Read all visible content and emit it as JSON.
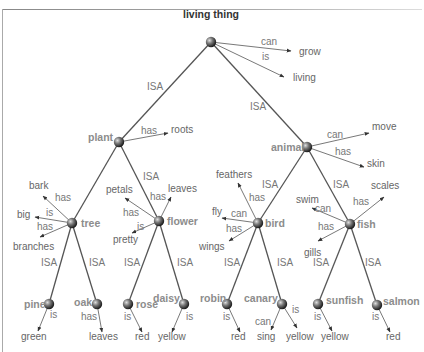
{
  "diagram": {
    "type": "semantic-network",
    "root": {
      "id": "living_thing",
      "label": "living thing"
    },
    "nodes": [
      {
        "id": "living_thing",
        "label": "living thing",
        "x": 211,
        "y": 42,
        "lx": 183,
        "ly": 18,
        "anchor": "start",
        "root": true
      },
      {
        "id": "plant",
        "label": "plant",
        "x": 119,
        "y": 142,
        "lx": 88,
        "ly": 141,
        "anchor": "start"
      },
      {
        "id": "animal",
        "label": "animal",
        "x": 307,
        "y": 147,
        "lx": 271,
        "ly": 151,
        "anchor": "start"
      },
      {
        "id": "tree",
        "label": "tree",
        "x": 72,
        "y": 223,
        "lx": 81,
        "ly": 227,
        "anchor": "start"
      },
      {
        "id": "flower",
        "label": "flower",
        "x": 159,
        "y": 221,
        "lx": 167,
        "ly": 225,
        "anchor": "start"
      },
      {
        "id": "bird",
        "label": "bird",
        "x": 258,
        "y": 223,
        "lx": 265,
        "ly": 227,
        "anchor": "start"
      },
      {
        "id": "fish",
        "label": "fish",
        "x": 350,
        "y": 224,
        "lx": 357,
        "ly": 228,
        "anchor": "start"
      },
      {
        "id": "pine",
        "label": "pine",
        "x": 49,
        "y": 304,
        "lx": 24,
        "ly": 308,
        "anchor": "start"
      },
      {
        "id": "oak",
        "label": "oak",
        "x": 97,
        "y": 304,
        "lx": 74,
        "ly": 306,
        "anchor": "start"
      },
      {
        "id": "rose",
        "label": "rose",
        "x": 128,
        "y": 304,
        "lx": 136,
        "ly": 308,
        "anchor": "start"
      },
      {
        "id": "daisy",
        "label": "daisy",
        "x": 184,
        "y": 304,
        "lx": 153,
        "ly": 302,
        "anchor": "start"
      },
      {
        "id": "robin",
        "label": "robin",
        "x": 227,
        "y": 304,
        "lx": 200,
        "ly": 302,
        "anchor": "start"
      },
      {
        "id": "canary",
        "label": "canary",
        "x": 282,
        "y": 304,
        "lx": 244,
        "ly": 302,
        "anchor": "start"
      },
      {
        "id": "sunfish",
        "label": "sunfish",
        "x": 318,
        "y": 304,
        "lx": 326,
        "ly": 304,
        "anchor": "start"
      },
      {
        "id": "salmon",
        "label": "salmon",
        "x": 377,
        "y": 305,
        "lx": 383,
        "ly": 305,
        "anchor": "start"
      }
    ],
    "isa_edges": [
      {
        "from": "living_thing",
        "to": "plant",
        "label": "ISA",
        "lx": 147,
        "ly": 90
      },
      {
        "from": "living_thing",
        "to": "animal",
        "label": "ISA",
        "lx": 250,
        "ly": 110
      },
      {
        "from": "plant",
        "to": "tree",
        "label": "ISA",
        "lx": 0,
        "ly": 0,
        "hidden_label": true
      },
      {
        "from": "plant",
        "to": "flower",
        "label": "ISA",
        "lx": 143,
        "ly": 180
      },
      {
        "from": "animal",
        "to": "bird",
        "label": "ISA",
        "lx": 262,
        "ly": 188
      },
      {
        "from": "animal",
        "to": "fish",
        "label": "ISA",
        "lx": 333,
        "ly": 188
      },
      {
        "from": "tree",
        "to": "pine",
        "label": "ISA",
        "lx": 41,
        "ly": 266
      },
      {
        "from": "tree",
        "to": "oak",
        "label": "ISA",
        "lx": 89,
        "ly": 266
      },
      {
        "from": "flower",
        "to": "rose",
        "label": "ISA",
        "lx": 124,
        "ly": 266
      },
      {
        "from": "flower",
        "to": "daisy",
        "label": "ISA",
        "lx": 177,
        "ly": 266
      },
      {
        "from": "bird",
        "to": "robin",
        "label": "ISA",
        "lx": 224,
        "ly": 266
      },
      {
        "from": "bird",
        "to": "canary",
        "label": "ISA",
        "lx": 277,
        "ly": 266
      },
      {
        "from": "fish",
        "to": "sunfish",
        "label": "ISA",
        "lx": 313,
        "ly": 266
      },
      {
        "from": "fish",
        "to": "salmon",
        "label": "ISA",
        "lx": 365,
        "ly": 266
      }
    ],
    "property_edges": [
      {
        "from": "living_thing",
        "rel": "can",
        "value": "grow",
        "ex": 291,
        "ey": 51,
        "vx": 299,
        "vy": 55,
        "rx": 261,
        "ry": 45
      },
      {
        "from": "living_thing",
        "rel": "is",
        "value": "living",
        "ex": 284,
        "ey": 77,
        "vx": 293,
        "vy": 81,
        "rx": 262,
        "ry": 60
      },
      {
        "from": "plant",
        "rel": "has",
        "value": "roots",
        "ex": 168,
        "ey": 133,
        "vx": 171,
        "vy": 133,
        "rx": 141,
        "ry": 134
      },
      {
        "from": "animal",
        "rel": "can",
        "value": "move",
        "ex": 369,
        "ey": 133,
        "vx": 372,
        "vy": 130,
        "rx": 327,
        "ry": 138
      },
      {
        "from": "animal",
        "rel": "has",
        "value": "skin",
        "ex": 364,
        "ey": 167,
        "vx": 367,
        "vy": 167,
        "rx": 335,
        "ry": 155
      },
      {
        "from": "tree",
        "rel": "has",
        "value": "bark",
        "ex": 43,
        "ey": 196,
        "vx": 29,
        "vy": 189,
        "rx": 55,
        "ry": 201
      },
      {
        "from": "tree",
        "rel": "is",
        "value": "big",
        "ex": 35,
        "ey": 217,
        "vx": 17,
        "vy": 218,
        "rx": 46,
        "ry": 216
      },
      {
        "from": "tree",
        "rel": "has",
        "value": "branches",
        "ex": 40,
        "ey": 237,
        "vx": 13,
        "vy": 250,
        "rx": 37,
        "ry": 230
      },
      {
        "from": "flower",
        "rel": "has",
        "value": "petals",
        "ex": 125,
        "ey": 198,
        "vx": 106,
        "vy": 193,
        "rx": 123,
        "ry": 216
      },
      {
        "from": "flower",
        "rel": "has",
        "value": "leaves",
        "ex": 171,
        "ey": 197,
        "vx": 168,
        "vy": 192,
        "rx": 150,
        "ry": 200
      },
      {
        "from": "flower",
        "rel": "is",
        "value": "pretty",
        "ex": 132,
        "ey": 233,
        "vx": 113,
        "vy": 243,
        "rx": 137,
        "ry": 230
      },
      {
        "from": "bird",
        "rel": "has",
        "value": "feathers",
        "ex": 238,
        "ey": 183,
        "vx": 216,
        "vy": 178,
        "rx": 249,
        "ry": 201
      },
      {
        "from": "bird",
        "rel": "can",
        "value": "fly",
        "ex": 222,
        "ey": 218,
        "vx": 212,
        "vy": 215,
        "rx": 231,
        "ry": 217
      },
      {
        "from": "bird",
        "rel": "has",
        "value": "wings",
        "ex": 229,
        "ey": 241,
        "vx": 199,
        "vy": 250,
        "rx": 226,
        "ry": 232
      },
      {
        "from": "fish",
        "rel": "can",
        "value": "swim",
        "ex": 312,
        "ey": 208,
        "vx": 296,
        "vy": 203,
        "rx": 315,
        "ry": 212
      },
      {
        "from": "fish",
        "rel": "has",
        "value": "scales",
        "ex": 384,
        "ey": 197,
        "vx": 371,
        "vy": 189,
        "rx": 353,
        "ry": 205
      },
      {
        "from": "fish",
        "rel": "has",
        "value": "gills",
        "ex": 318,
        "ey": 241,
        "vx": 304,
        "vy": 256,
        "rx": 318,
        "ry": 230
      },
      {
        "from": "pine",
        "rel": "is",
        "value": "green",
        "ex": 38,
        "ey": 331,
        "vx": 21,
        "vy": 340,
        "rx": 50,
        "ry": 318
      },
      {
        "from": "oak",
        "rel": "has",
        "value": "leaves",
        "ex": 102,
        "ey": 332,
        "vx": 89,
        "vy": 340,
        "rx": 81,
        "ry": 320
      },
      {
        "from": "rose",
        "rel": "is",
        "value": "red",
        "ex": 142,
        "ey": 332,
        "vx": 135,
        "vy": 340,
        "rx": 124,
        "ry": 320
      },
      {
        "from": "daisy",
        "rel": "is",
        "value": "yellow",
        "ex": 172,
        "ey": 332,
        "vx": 158,
        "vy": 340,
        "rx": 186,
        "ry": 320
      },
      {
        "from": "robin",
        "rel": "is",
        "value": "red",
        "ex": 240,
        "ey": 332,
        "vx": 231,
        "vy": 340,
        "rx": 223,
        "ry": 320
      },
      {
        "from": "canary",
        "rel": "can",
        "value": "sing",
        "ex": 271,
        "ey": 330,
        "vx": 257,
        "vy": 340,
        "rx": 255,
        "ry": 325
      },
      {
        "from": "canary",
        "rel": "is",
        "value": "yellow",
        "ex": 297,
        "ey": 328,
        "vx": 286,
        "vy": 340,
        "rx": 292,
        "ry": 313
      },
      {
        "from": "sunfish",
        "rel": "is",
        "value": "yellow",
        "ex": 332,
        "ey": 331,
        "vx": 321,
        "vy": 340,
        "rx": 314,
        "ry": 320
      },
      {
        "from": "salmon",
        "rel": "is",
        "value": "red",
        "ex": 390,
        "ey": 332,
        "vx": 386,
        "vy": 340,
        "rx": 372,
        "ry": 320
      }
    ]
  },
  "colors": {
    "line": "#555555",
    "node_label": "#8c8c8c",
    "root_label": "#333333",
    "rel_label": "#777777",
    "value_label": "#666666",
    "node_sphere_dark": "#2a2a2a",
    "node_sphere_light": "#d0d0d0"
  }
}
